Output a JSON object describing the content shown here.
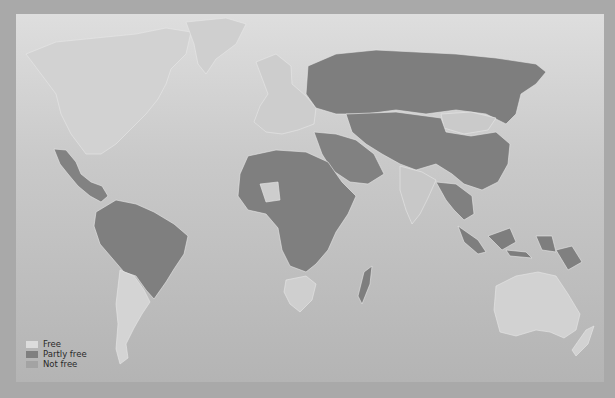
{
  "map": {
    "title": "",
    "colors": {
      "background": "#a9a9a9",
      "ocean_top": "#dedede",
      "ocean_bottom": "#b4b4b4",
      "free": "#d9d9d9",
      "partly_free": "#808080",
      "not_free": "#9a9a9a",
      "border": "#e8e8e8"
    }
  },
  "legend": {
    "items": [
      {
        "label": "Free",
        "color": "#dcdcdc"
      },
      {
        "label": "Partly free",
        "color": "#7f7f7f"
      },
      {
        "label": "Not free",
        "color": "#a3a3a3"
      }
    ]
  }
}
